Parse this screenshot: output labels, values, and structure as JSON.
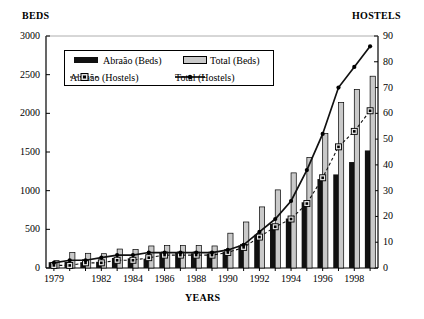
{
  "chart_data": {
    "type": "bar",
    "title": "",
    "xlabel": "YEARS",
    "ylabel": "BEDS",
    "y2label": "HOSTELS",
    "grid": false,
    "legend_position": "top-left-inside",
    "ylim": [
      0,
      3000
    ],
    "y2lim": [
      0,
      90
    ],
    "yticks": [
      "0",
      "500",
      "1000",
      "1500",
      "2000",
      "2500",
      "3000"
    ],
    "y2ticks": [
      "0",
      "10",
      "20",
      "30",
      "40",
      "50",
      "60",
      "70",
      "80",
      "90"
    ],
    "categories": [
      1979,
      1980,
      1981,
      1982,
      1983,
      1984,
      1985,
      1986,
      1987,
      1988,
      1989,
      1990,
      1991,
      1992,
      1993,
      1994,
      1995,
      1996,
      1997,
      1998,
      1999
    ],
    "xticklabels": [
      "1979",
      "",
      "",
      "1982",
      "",
      "1984",
      "",
      "1986",
      "",
      "1988",
      "",
      "1990",
      "",
      "1992",
      "",
      "1994",
      "",
      "1996",
      "",
      "1998",
      ""
    ],
    "series": [
      {
        "name": "Abraão (Beds)",
        "axis": "left",
        "style": "bar-solid",
        "color": "#111111",
        "values": [
          75,
          80,
          75,
          80,
          130,
          125,
          120,
          200,
          200,
          190,
          185,
          210,
          290,
          430,
          570,
          640,
          850,
          1150,
          1210,
          1370,
          1520
        ]
      },
      {
        "name": "Total (Beds)",
        "axis": "left",
        "style": "bar-open",
        "color": "#c9c9c9",
        "values": [
          95,
          200,
          190,
          185,
          245,
          240,
          285,
          290,
          290,
          290,
          285,
          450,
          595,
          790,
          1010,
          1230,
          1430,
          1740,
          2140,
          2310,
          2480
        ]
      },
      {
        "name": "Abraão (Hostels)",
        "axis": "right",
        "style": "line-dashed-square",
        "color": "#111111",
        "values": [
          1,
          1,
          2,
          2,
          3,
          3,
          4,
          5,
          5,
          5,
          5,
          6,
          8,
          12,
          16,
          19,
          25,
          35,
          47,
          53,
          61
        ]
      },
      {
        "name": "Total (Hostels)",
        "axis": "right",
        "style": "line-solid-dot",
        "color": "#111111",
        "values": [
          2,
          3,
          3,
          4,
          5,
          5,
          6,
          6,
          6,
          6,
          6,
          7,
          9,
          14,
          19,
          26,
          38,
          52,
          70,
          78,
          86
        ]
      }
    ]
  },
  "legend": {
    "items": [
      {
        "label": "Abraão (Beds)"
      },
      {
        "label": "Total (Beds)"
      },
      {
        "label": "Abraão (Hostels)"
      },
      {
        "label": "Total (Hostels)"
      }
    ]
  }
}
